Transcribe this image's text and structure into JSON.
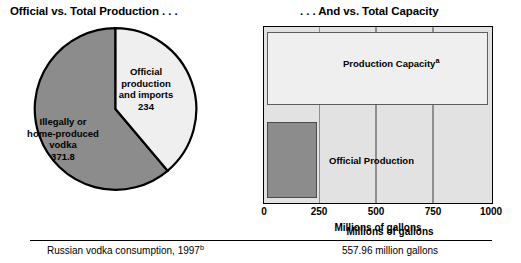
{
  "panels": {
    "left_title": "Official vs. Total Production . . .",
    "right_title": ". . . And vs. Total Capacity"
  },
  "pie_labels": {
    "official": "Official\nproduction\nand imports\n234",
    "illegal": "Illegally or\nhome-produced\nvodka\n371.8"
  },
  "bar_labels": {
    "capacity": "Production Capacity",
    "capacity_note": "a",
    "official": "Official Production"
  },
  "axis": {
    "title": "Millions of gallons",
    "ticks": [
      "0",
      "250",
      "500",
      "750",
      "1000"
    ]
  },
  "footer": {
    "header": "Millions of gallons",
    "row_label": "Russian vodka consumption, 1997",
    "row_label_note": "b",
    "row_value": "557.96 million gallons"
  },
  "colors": {
    "pie_light": "#efefef",
    "pie_dark": "#8c8c8c",
    "plot_background": "#e2e2e2",
    "gridline": "#8f8f8f",
    "outline": "#000000"
  },
  "chart_data": [
    {
      "type": "pie",
      "title": "Official vs. Total Production . . .",
      "labels": [
        "Official production and imports",
        "Illegally or home-produced vodka"
      ],
      "values": [
        234,
        371.8
      ],
      "value_labels": [
        "234",
        "371.8"
      ],
      "unit": "millions of gallons",
      "total": 605.8,
      "start_angle_deg": 0,
      "direction": "clockwise",
      "slice_colors": [
        "#efefef",
        "#8c8c8c"
      ],
      "legend": "inside-slices"
    },
    {
      "type": "bar",
      "orientation": "horizontal",
      "title": ". . . And vs. Total Capacity",
      "categories": [
        "Production Capacity",
        "Official Production"
      ],
      "values": [
        980,
        234
      ],
      "xlabel": "Millions of gallons",
      "ylabel": "",
      "xlim": [
        0,
        1000
      ],
      "xticks": [
        0,
        250,
        500,
        750,
        1000
      ],
      "grid": "vertical",
      "bar_colors": [
        "#efefef",
        "#8c8c8c"
      ],
      "legend": "inside-bars"
    },
    {
      "type": "table",
      "columns": [
        "",
        "Millions of gallons"
      ],
      "rows": [
        [
          "Russian vodka consumption, 1997",
          "557.96 million gallons"
        ]
      ]
    }
  ]
}
